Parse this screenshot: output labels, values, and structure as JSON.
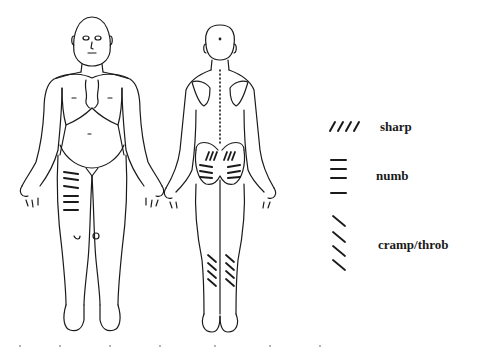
{
  "document": {
    "type": "pain-diagram",
    "figures": [
      {
        "id": "front",
        "view": "anterior"
      },
      {
        "id": "back",
        "view": "posterior"
      }
    ],
    "legend": [
      {
        "key": "sharp",
        "label": "sharp",
        "pattern": "diagonal-forward-slashes"
      },
      {
        "key": "numb",
        "label": "numb",
        "pattern": "horizontal-lines"
      },
      {
        "key": "cramp",
        "label": "cramp/throb",
        "pattern": "diagonal-back-slashes"
      }
    ],
    "markings": [
      {
        "figure": "front",
        "region": "right-thigh",
        "pattern": "numb"
      },
      {
        "figure": "back",
        "region": "lower-back",
        "pattern": "sharp"
      },
      {
        "figure": "back",
        "region": "buttocks",
        "pattern": "numb"
      },
      {
        "figure": "back",
        "region": "calves",
        "pattern": "cramp"
      }
    ],
    "colors": {
      "ink": "#1a1a1a",
      "paper": "#ffffff"
    }
  }
}
